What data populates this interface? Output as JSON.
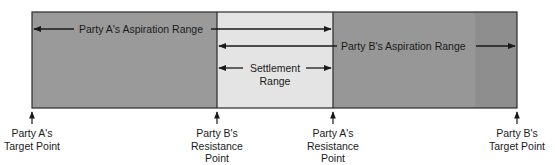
{
  "diagram": {
    "colors": {
      "dark_region": "#9a9a9a",
      "dark_strip": "#8e8e8e",
      "settlement_region": "#e4e4e4",
      "border": "#2a2a2a",
      "arrow": "#1a1a1a"
    },
    "ranges": {
      "party_a_aspiration": "Party A's Aspiration Range",
      "party_b_aspiration": "Party B's Aspiration Range",
      "settlement": {
        "line1": "Settlement",
        "line2": "Range"
      }
    },
    "points": [
      {
        "id": "a-target",
        "line1": "Party A's",
        "line2": "Target Point",
        "line3": ""
      },
      {
        "id": "b-resistance",
        "line1": "Party B's",
        "line2": "Resistance",
        "line3": "Point"
      },
      {
        "id": "a-resistance",
        "line1": "Party A's",
        "line2": "Resistance",
        "line3": "Point"
      },
      {
        "id": "b-target",
        "line1": "Party B's",
        "line2": "Target Point",
        "line3": ""
      }
    ]
  }
}
